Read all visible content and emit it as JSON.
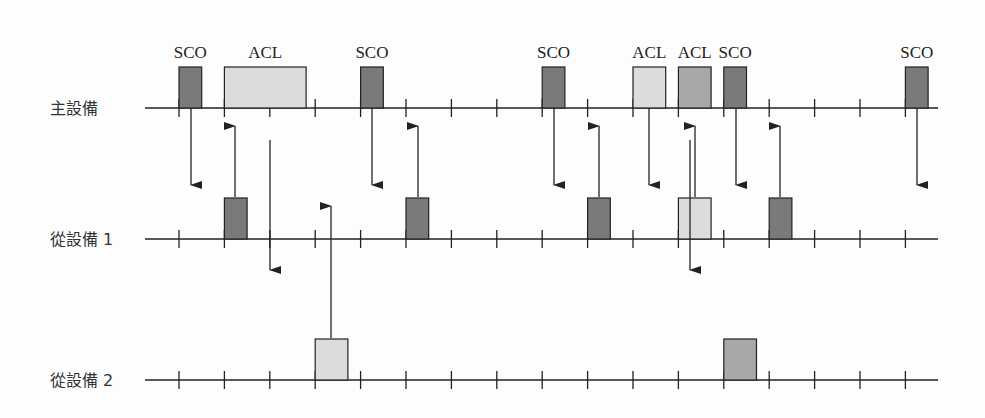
{
  "diagram": {
    "title": "",
    "colors": {
      "line": "#222222",
      "sco": "#7a7a7a",
      "acl_light": "#dcdcdc",
      "acl_mid": "#a8a8a8"
    },
    "timeline": {
      "x_start": 145,
      "x_end": 938,
      "tick_x0": 179,
      "tick_spacing": 45.4,
      "tick_count": 17,
      "tick_half": 9
    },
    "rows": [
      {
        "id": "master",
        "label": "主設備",
        "y": 108,
        "label_x": 50
      },
      {
        "id": "slave1",
        "label": "從設備 1",
        "y": 239,
        "label_x": 50
      },
      {
        "id": "slave2",
        "label": "從設備 2",
        "y": 380,
        "label_x": 50
      }
    ],
    "packets": [
      {
        "row": 0,
        "slot": 0,
        "width": 0.5,
        "type": "sco",
        "label": "SCO"
      },
      {
        "row": 0,
        "slot": 1,
        "width": 1.8,
        "type": "acl_light",
        "label": "ACL"
      },
      {
        "row": 0,
        "slot": 4,
        "width": 0.5,
        "type": "sco",
        "label": "SCO"
      },
      {
        "row": 0,
        "slot": 8,
        "width": 0.5,
        "type": "sco",
        "label": "SCO"
      },
      {
        "row": 0,
        "slot": 10,
        "width": 0.72,
        "type": "acl_light",
        "label": "ACL"
      },
      {
        "row": 0,
        "slot": 11,
        "width": 0.72,
        "type": "acl_mid",
        "label": "ACL"
      },
      {
        "row": 0,
        "slot": 12,
        "width": 0.5,
        "type": "sco",
        "label": "SCO"
      },
      {
        "row": 0,
        "slot": 16,
        "width": 0.5,
        "type": "sco",
        "label": "SCO"
      },
      {
        "row": 1,
        "slot": 1,
        "width": 0.5,
        "type": "sco",
        "label": ""
      },
      {
        "row": 1,
        "slot": 5,
        "width": 0.5,
        "type": "sco",
        "label": ""
      },
      {
        "row": 1,
        "slot": 9,
        "width": 0.5,
        "type": "sco",
        "label": ""
      },
      {
        "row": 1,
        "slot": 11,
        "width": 0.72,
        "type": "acl_light",
        "label": ""
      },
      {
        "row": 1,
        "slot": 13,
        "width": 0.5,
        "type": "sco",
        "label": ""
      },
      {
        "row": 2,
        "slot": 3,
        "width": 0.72,
        "type": "acl_light",
        "label": ""
      },
      {
        "row": 2,
        "slot": 12,
        "width": 0.72,
        "type": "acl_mid",
        "label": ""
      }
    ],
    "arrows": [
      {
        "x": 191,
        "y1": 108,
        "y2": 185,
        "dir": "down"
      },
      {
        "x": 235,
        "y1": 197,
        "y2": 126,
        "dir": "up"
      },
      {
        "x": 270,
        "y1": 140,
        "y2": 270,
        "dir": "down"
      },
      {
        "x": 331,
        "y1": 338,
        "y2": 206,
        "dir": "up"
      },
      {
        "x": 372,
        "y1": 108,
        "y2": 185,
        "dir": "down"
      },
      {
        "x": 418,
        "y1": 197,
        "y2": 126,
        "dir": "up"
      },
      {
        "x": 554,
        "y1": 108,
        "y2": 185,
        "dir": "down"
      },
      {
        "x": 599,
        "y1": 197,
        "y2": 126,
        "dir": "up"
      },
      {
        "x": 649,
        "y1": 108,
        "y2": 185,
        "dir": "down"
      },
      {
        "x": 690,
        "y1": 140,
        "y2": 270,
        "dir": "down"
      },
      {
        "x": 695,
        "y1": 197,
        "y2": 126,
        "dir": "up"
      },
      {
        "x": 736,
        "y1": 108,
        "y2": 185,
        "dir": "down"
      },
      {
        "x": 780,
        "y1": 197,
        "y2": 126,
        "dir": "up"
      },
      {
        "x": 917,
        "y1": 108,
        "y2": 185,
        "dir": "down"
      }
    ],
    "packet_height": 41,
    "label_offset": 14
  }
}
